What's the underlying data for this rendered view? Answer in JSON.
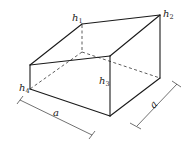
{
  "diagram": {
    "type": "isometric-solid",
    "vertex_labels": {
      "h1": {
        "base": "h",
        "sub": "1"
      },
      "h2": {
        "base": "h",
        "sub": "2"
      },
      "h3": {
        "base": "h",
        "sub": "3"
      },
      "h4": {
        "base": "h",
        "sub": "4"
      }
    },
    "dimensions": {
      "front_side": "a",
      "right_side": "a"
    },
    "colors": {
      "line": "#1a1a1a",
      "background": "#ffffff"
    }
  }
}
